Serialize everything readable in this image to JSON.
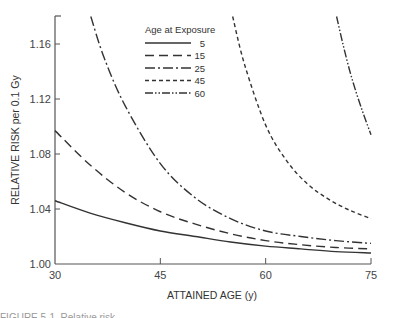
{
  "chart_data": {
    "type": "line",
    "title": "",
    "xlabel": "ATTAINED AGE (y)",
    "ylabel": "RELATIVE RISK per 0.1 Gy",
    "xlim": [
      30,
      75
    ],
    "ylim": [
      1.0,
      1.18
    ],
    "xticks": [
      "30",
      "45",
      "60",
      "75"
    ],
    "yticks": [
      "1.00",
      "1.04",
      "1.08",
      "1.12",
      "1.16"
    ],
    "grid": false,
    "legend": {
      "title": "Age at Exposure",
      "position": "upper-center"
    },
    "series": [
      {
        "name": "5",
        "style": "solid",
        "x": [
          30,
          35,
          40,
          45,
          50,
          55,
          60,
          65,
          70,
          75
        ],
        "values": [
          1.046,
          1.037,
          1.03,
          1.024,
          1.02,
          1.016,
          1.013,
          1.011,
          1.009,
          1.008
        ]
      },
      {
        "name": "15",
        "style": "long-dash",
        "x": [
          30,
          35,
          40,
          45,
          50,
          55,
          60,
          65,
          70,
          75
        ],
        "values": [
          1.097,
          1.072,
          1.052,
          1.038,
          1.029,
          1.022,
          1.017,
          1.014,
          1.012,
          1.011
        ]
      },
      {
        "name": "25",
        "style": "dash-dot",
        "x": [
          35.1,
          37,
          40,
          45,
          50,
          55,
          60,
          65,
          70,
          75
        ],
        "values": [
          1.18,
          1.15,
          1.115,
          1.073,
          1.048,
          1.033,
          1.024,
          1.02,
          1.017,
          1.015
        ]
      },
      {
        "name": "45",
        "style": "short-dash",
        "x": [
          55.3,
          57,
          60,
          63,
          66,
          69,
          72,
          75
        ],
        "values": [
          1.18,
          1.145,
          1.101,
          1.075,
          1.058,
          1.047,
          1.039,
          1.033
        ]
      },
      {
        "name": "60",
        "style": "dash-dot-dot",
        "x": [
          70.1,
          71,
          72,
          73,
          74,
          75
        ],
        "values": [
          1.18,
          1.16,
          1.14,
          1.123,
          1.108,
          1.094
        ]
      }
    ]
  },
  "caption": "FIGURE 5-1. Relative risk"
}
